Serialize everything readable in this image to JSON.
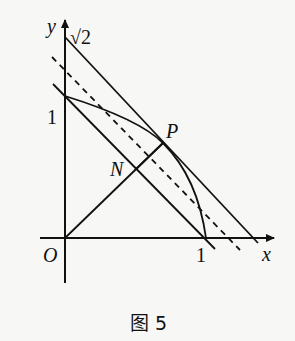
{
  "figure": {
    "caption": "图 5",
    "axes": {
      "x_label": "x",
      "y_label": "y",
      "origin_label": "O"
    },
    "tick_labels": {
      "x_one": "1",
      "y_one": "1",
      "y_sqrt2": "√2"
    },
    "points": {
      "P": "P",
      "N": "N"
    },
    "elements": [
      {
        "name": "line x+y=√2",
        "style": "solid"
      },
      {
        "name": "dashed parallel line",
        "style": "dashed"
      },
      {
        "name": "line x+y=1",
        "style": "solid"
      },
      {
        "name": "arc from (0,1) to (1,0) through P",
        "style": "solid"
      },
      {
        "name": "segment ON through N to P",
        "style": "solid"
      }
    ],
    "colors": {
      "ink": "#111111",
      "background": "#f7f7f5"
    }
  }
}
